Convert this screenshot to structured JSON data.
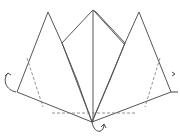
{
  "diagram": {
    "stroke_color": "#555555",
    "background": "#ffffff",
    "vertices": {
      "left_peak": [
        48,
        12
      ],
      "right_peak": [
        139,
        12
      ],
      "center_top": [
        93,
        10
      ],
      "bottom_center": [
        92,
        122
      ],
      "left_corner": [
        17,
        92
      ],
      "right_corner": [
        171,
        92
      ],
      "left_inner": [
        62,
        43
      ],
      "right_inner": [
        125,
        43
      ]
    },
    "fold_lines": {
      "horizontal_dashed_y": 113,
      "left_diagonal_dashed": [
        [
          27,
          58
        ],
        [
          42,
          107
        ]
      ],
      "right_diagonal_dashed": [
        [
          160,
          58
        ],
        [
          145,
          107
        ]
      ]
    },
    "arrows": [
      {
        "name": "left-fold-arrow",
        "position": [
          8,
          72
        ],
        "direction": "fold-behind"
      },
      {
        "name": "right-fold-arrow",
        "position": [
          174,
          74
        ],
        "direction": "fold-behind"
      },
      {
        "name": "bottom-fold-arrow",
        "position": [
          100,
          126
        ],
        "direction": "fold-behind"
      }
    ]
  }
}
